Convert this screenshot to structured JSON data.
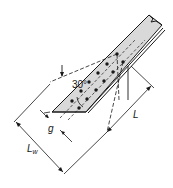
{
  "diagram": {
    "labels": {
      "angle": "30°",
      "length": "L",
      "gage": "g",
      "whitmore_width_main": "L",
      "whitmore_width_sub": "w"
    },
    "colors": {
      "member_fill": "#d9d9d9",
      "line": "#1a1a1a",
      "background": "#ffffff"
    },
    "bolts": {
      "rows": 2,
      "per_row": 6
    }
  }
}
